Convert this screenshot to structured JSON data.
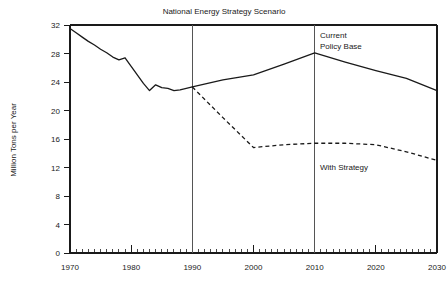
{
  "chart_data": {
    "type": "line",
    "title": "National Energy Strategy Scenario",
    "xlabel": "",
    "ylabel": "Million Tons per Year",
    "xlim": [
      1970,
      2030
    ],
    "ylim": [
      0,
      32
    ],
    "yticks": [
      0,
      4,
      8,
      12,
      16,
      20,
      24,
      28,
      32
    ],
    "xticks": [
      1970,
      1980,
      1990,
      2000,
      2010,
      2020,
      2030
    ],
    "xtick_minor_step": 1,
    "grid": false,
    "legend_position": "inline-annotations",
    "reference_lines": [
      1990,
      2010
    ],
    "series": [
      {
        "name": "Historical",
        "style": "solid",
        "x": [
          1970,
          1971,
          1972,
          1973,
          1974,
          1975,
          1976,
          1977,
          1978,
          1979,
          1980,
          1981,
          1982,
          1983,
          1984,
          1985,
          1986,
          1987,
          1988,
          1989,
          1990
        ],
        "values": [
          31.5,
          30.9,
          30.3,
          29.7,
          29.2,
          28.6,
          28.1,
          27.5,
          27.1,
          27.4,
          26.2,
          25.0,
          23.8,
          22.8,
          23.6,
          23.2,
          23.1,
          22.8,
          22.9,
          23.1,
          23.3
        ]
      },
      {
        "name": "Current Policy Base",
        "style": "solid",
        "x": [
          1990,
          1995,
          2000,
          2005,
          2010,
          2015,
          2020,
          2025,
          2030
        ],
        "values": [
          23.3,
          24.3,
          25.0,
          26.5,
          28.1,
          26.8,
          25.6,
          24.5,
          22.8
        ]
      },
      {
        "name": "With Strategy",
        "style": "dashed",
        "x": [
          1990,
          1995,
          2000,
          2005,
          2010,
          2015,
          2020,
          2025,
          2030
        ],
        "values": [
          23.3,
          19.0,
          14.8,
          15.2,
          15.4,
          15.4,
          15.2,
          14.2,
          13.0
        ]
      }
    ],
    "annotations": [
      {
        "text": "Current",
        "x": 2012,
        "y": 30.4
      },
      {
        "text": "Policy Base",
        "x": 2012,
        "y": 29.0
      },
      {
        "text": "With Strategy",
        "x": 2012,
        "y": 12.3
      }
    ],
    "colors": {
      "line": "#1a1a1a",
      "reference_line": "#555555",
      "background": "#ffffff"
    }
  },
  "labels": {
    "title": "National Energy Strategy Scenario",
    "ylabel": "Million Tons per Year",
    "y_ticks": [
      "0",
      "4",
      "8",
      "12",
      "16",
      "20",
      "24",
      "28",
      "32"
    ],
    "x_ticks": [
      "1970",
      "1980",
      "1990",
      "2000",
      "2010",
      "2020",
      "2030"
    ],
    "annotation_current": "Current",
    "annotation_policy_base": "Policy Base",
    "annotation_with_strategy": "With Strategy"
  }
}
